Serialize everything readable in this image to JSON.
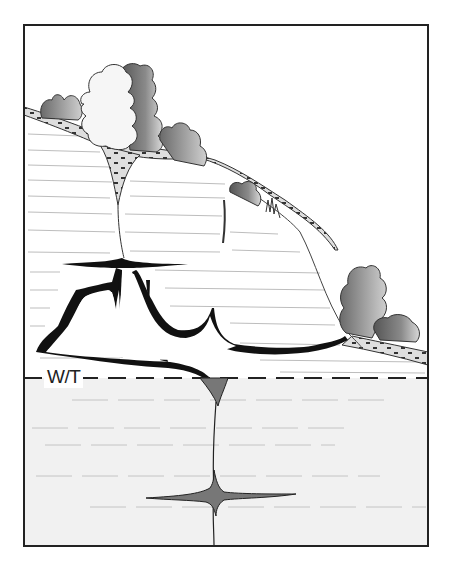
{
  "diagram": {
    "type": "karst cross-section",
    "labels": {
      "water_table": "W/T"
    },
    "colors": {
      "frame": "#222222",
      "saturated_zone": "#f1f1f1",
      "cave_fill": "#111111",
      "water_filled_conduit": "#777777",
      "soil_fill": "#dcdcdc",
      "bedding_lines": "#bbbbbb",
      "vegetation_light": "#f3f3f3",
      "vegetation_dark": "#6e6e6e"
    },
    "elements": [
      "soil layer with pebbles",
      "trees/vegetation on hillslope",
      "vertical solution fissures",
      "air-filled cave system above water table",
      "water table dashed line",
      "water-filled conduit below water table",
      "bedding planes"
    ]
  }
}
